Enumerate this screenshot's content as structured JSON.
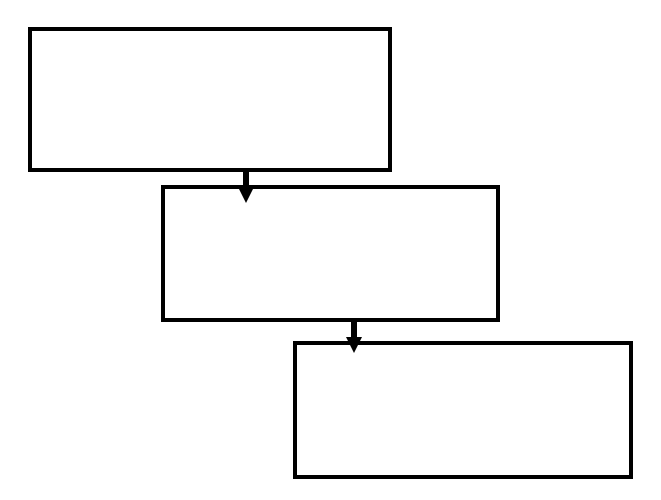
{
  "diagram": {
    "type": "flowchart",
    "direction": "top-to-bottom, staircase right",
    "stroke_color": "#000000",
    "fill_color": "#ffffff",
    "background": "#ffffff",
    "nodes": [
      {
        "id": "box-1",
        "label": "",
        "x": 28,
        "y": 27,
        "w": 364,
        "h": 145
      },
      {
        "id": "box-2",
        "label": "",
        "x": 161,
        "y": 185,
        "w": 339,
        "h": 137
      },
      {
        "id": "box-3",
        "label": "",
        "x": 293,
        "y": 341,
        "w": 340,
        "h": 138
      }
    ],
    "edges": [
      {
        "from": "box-1",
        "to": "box-2",
        "x": 246,
        "y_start": 171,
        "y_end": 202
      },
      {
        "from": "box-2",
        "to": "box-3",
        "x": 354,
        "y_start": 321,
        "y_end": 353
      }
    ]
  }
}
